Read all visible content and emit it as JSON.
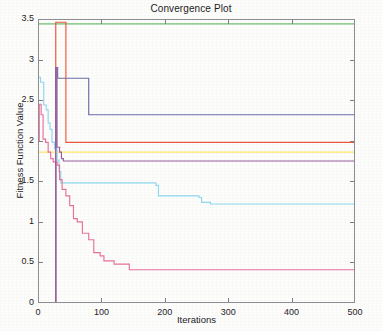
{
  "chart_data": {
    "type": "line",
    "title": "Convergence Plot",
    "xlabel": "Iterations",
    "ylabel": "Fitness Function Value",
    "xlim": [
      0,
      500
    ],
    "ylim": [
      0,
      3.5
    ],
    "xticks": [
      0,
      100,
      200,
      300,
      400,
      500
    ],
    "xtick_labels": [
      "0",
      "100",
      "200",
      "300",
      "400",
      "500"
    ],
    "yticks": [
      0,
      0.5,
      1,
      1.5,
      2,
      2.5,
      3,
      3.5
    ],
    "ytick_labels": [
      "0",
      "0.5",
      "1",
      "1.5",
      "2",
      "2.5",
      "3",
      "3.5"
    ],
    "grid": false,
    "legend": null,
    "step_style": "post",
    "series": [
      {
        "name": "green-curve",
        "color": "#6fbf73",
        "final_value": 3.44,
        "x": [
          0,
          500
        ],
        "y": [
          3.44,
          3.44
        ]
      },
      {
        "name": "dark-navy-top-curve",
        "color": "#565a7a",
        "final_value": 3.5,
        "x": [
          0,
          500
        ],
        "y": [
          3.5,
          3.5
        ]
      },
      {
        "name": "red-curve",
        "color": "#f0563c",
        "final_value": 1.98,
        "x": [
          0,
          28,
          28,
          31,
          31,
          44,
          44,
          500
        ],
        "y": [
          0.0,
          0.0,
          3.46,
          3.46,
          3.46,
          3.46,
          1.98,
          1.98
        ]
      },
      {
        "name": "blue-violet-curve",
        "color": "#6a6fa8",
        "final_value": 2.32,
        "x": [
          0,
          28,
          28,
          31,
          31,
          41,
          41,
          80,
          80,
          500
        ],
        "y": [
          0.0,
          0.0,
          2.9,
          2.9,
          2.77,
          2.77,
          2.77,
          2.77,
          2.32,
          2.32
        ]
      },
      {
        "name": "yellow-curve",
        "color": "#fbe96a",
        "final_value": 1.86,
        "x": [
          0,
          500
        ],
        "y": [
          1.86,
          1.86
        ]
      },
      {
        "name": "cyan-curve",
        "color": "#8fd9ef",
        "final_value": 1.22,
        "x": [
          0,
          4,
          4,
          9,
          9,
          13,
          13,
          16,
          16,
          19,
          19,
          22,
          22,
          26,
          26,
          30,
          30,
          33,
          33,
          36,
          36,
          186,
          186,
          190,
          190,
          254,
          254,
          258,
          258,
          272,
          272,
          500
        ],
        "y": [
          2.78,
          2.78,
          2.72,
          2.72,
          2.44,
          2.44,
          2.38,
          2.38,
          2.22,
          2.22,
          2.14,
          2.14,
          1.98,
          1.98,
          1.9,
          1.9,
          1.76,
          1.76,
          1.62,
          1.62,
          1.48,
          1.48,
          1.45,
          1.45,
          1.32,
          1.32,
          1.3,
          1.3,
          1.24,
          1.24,
          1.22,
          1.22
        ]
      },
      {
        "name": "magenta-curve",
        "color": "#e8719e",
        "final_value": 0.41,
        "x": [
          0,
          2,
          2,
          5,
          5,
          8,
          8,
          12,
          12,
          16,
          16,
          20,
          20,
          24,
          24,
          30,
          30,
          34,
          34,
          38,
          38,
          44,
          44,
          50,
          50,
          56,
          56,
          62,
          62,
          70,
          70,
          80,
          80,
          88,
          88,
          98,
          98,
          104,
          104,
          120,
          120,
          144,
          144,
          500
        ],
        "y": [
          2.0,
          2.0,
          2.45,
          2.45,
          2.32,
          2.32,
          2.02,
          2.02,
          1.98,
          1.98,
          1.86,
          1.86,
          1.78,
          1.78,
          1.74,
          1.74,
          1.7,
          1.7,
          1.52,
          1.52,
          1.4,
          1.4,
          1.32,
          1.32,
          1.2,
          1.2,
          1.04,
          1.04,
          1.0,
          1.0,
          0.86,
          0.86,
          0.78,
          0.78,
          0.62,
          0.62,
          0.58,
          0.58,
          0.52,
          0.52,
          0.48,
          0.48,
          0.41,
          0.41
        ]
      },
      {
        "name": "purple-zero-jump-curve",
        "color": "#9a5fa0",
        "final_value": 1.75,
        "x": [
          0,
          28,
          28,
          30,
          30,
          34,
          34,
          37,
          37,
          40,
          40,
          500
        ],
        "y": [
          0.0,
          0.0,
          2.9,
          2.9,
          1.92,
          1.92,
          1.86,
          1.86,
          1.78,
          1.78,
          1.75,
          1.75
        ]
      }
    ]
  }
}
